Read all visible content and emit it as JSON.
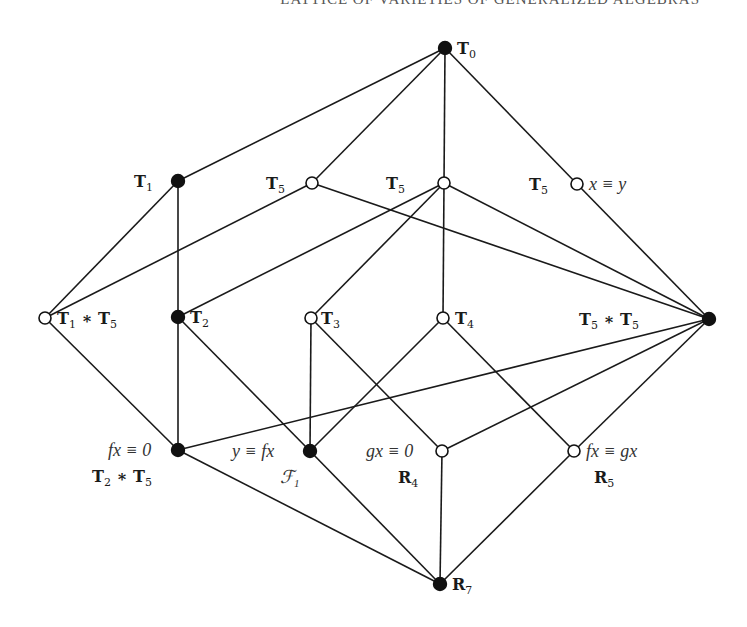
{
  "running_head": "LATTICE OF VARIETIES OF GENERALIZED ALGEBRAS",
  "colors": {
    "edge": "#1a1a1a",
    "filled": "#111111",
    "open": "#ffffff"
  },
  "nodes": [
    {
      "id": "T0",
      "x": 445,
      "y": 48,
      "filled": true,
      "labels": [
        {
          "text": "T",
          "sub": "0",
          "style": "bold",
          "dx": 12,
          "dy": 6
        }
      ]
    },
    {
      "id": "T1",
      "x": 178,
      "y": 181,
      "filled": true,
      "labels": [
        {
          "text": "T",
          "sub": "1",
          "style": "bold",
          "dx": -44,
          "dy": 6
        }
      ]
    },
    {
      "id": "T5a",
      "x": 312,
      "y": 183,
      "filled": false,
      "labels": [
        {
          "text": "T",
          "sub": "5",
          "style": "bold",
          "dx": -46,
          "dy": 6
        }
      ]
    },
    {
      "id": "T5b",
      "x": 444,
      "y": 183,
      "filled": false,
      "labels": [
        {
          "text": "T",
          "sub": "5",
          "style": "bold",
          "dx": -58,
          "dy": 6
        }
      ]
    },
    {
      "id": "T5c",
      "x": 577,
      "y": 184,
      "filled": false,
      "labels": [
        {
          "text": "T",
          "sub": "5",
          "style": "bold",
          "dx": -48,
          "dy": 6
        },
        {
          "text": "x ≡ y",
          "style": "italic",
          "dx": 12,
          "dy": 6
        }
      ]
    },
    {
      "id": "T1T5",
      "x": 45,
      "y": 318,
      "filled": false,
      "labels": [
        {
          "text": "T",
          "sub": "1",
          "mid": " ∗ T",
          "sub2": "5",
          "style": "bold",
          "dx": 12,
          "dy": 6
        }
      ]
    },
    {
      "id": "T2",
      "x": 178,
      "y": 317,
      "filled": true,
      "labels": [
        {
          "text": "T",
          "sub": "2",
          "style": "bold",
          "dx": 12,
          "dy": 6
        }
      ]
    },
    {
      "id": "T3",
      "x": 311,
      "y": 318,
      "filled": false,
      "labels": [
        {
          "text": "T",
          "sub": "3",
          "style": "bold",
          "dx": 10,
          "dy": 6
        }
      ]
    },
    {
      "id": "T4",
      "x": 443,
      "y": 318,
      "filled": false,
      "labels": [
        {
          "text": "T",
          "sub": "4",
          "style": "bold",
          "dx": 12,
          "dy": 6
        }
      ]
    },
    {
      "id": "T5T5",
      "x": 709,
      "y": 319,
      "filled": true,
      "labels": [
        {
          "text": "T",
          "sub": "5",
          "mid": " ∗ T",
          "sub2": "5",
          "style": "bold",
          "dx": -130,
          "dy": 6
        }
      ]
    },
    {
      "id": "T2T5",
      "x": 178,
      "y": 450,
      "filled": true,
      "labels": [
        {
          "text": "fx ≡ 0",
          "style": "italic",
          "dx": -70,
          "dy": 6
        },
        {
          "text": "T",
          "sub": "2",
          "mid": " ∗ T",
          "sub2": "5",
          "style": "bold",
          "dx": -86,
          "dy": 32
        }
      ]
    },
    {
      "id": "F1",
      "x": 310,
      "y": 451,
      "filled": true,
      "labels": [
        {
          "text": "y ≡ fx",
          "style": "italic",
          "dx": -78,
          "dy": 6
        },
        {
          "text": "ℱ",
          "sub": "1",
          "style": "italic",
          "dx": -30,
          "dy": 32
        }
      ]
    },
    {
      "id": "R4",
      "x": 442,
      "y": 451,
      "filled": false,
      "labels": [
        {
          "text": "gx ≡ 0",
          "style": "italic",
          "dx": -76,
          "dy": 6
        },
        {
          "text": "R",
          "sub": "4",
          "style": "bold",
          "dx": -44,
          "dy": 32
        }
      ]
    },
    {
      "id": "R5",
      "x": 574,
      "y": 451,
      "filled": false,
      "labels": [
        {
          "text": "fx ≡ gx",
          "style": "italic",
          "dx": 12,
          "dy": 6
        },
        {
          "text": "R",
          "sub": "5",
          "style": "bold",
          "dx": 20,
          "dy": 32
        }
      ]
    },
    {
      "id": "R7",
      "x": 440,
      "y": 584,
      "filled": true,
      "labels": [
        {
          "text": "R",
          "sub": "7",
          "style": "bold",
          "dx": 12,
          "dy": 6
        }
      ]
    }
  ],
  "edges": [
    [
      "T0",
      "T1"
    ],
    [
      "T0",
      "T5a"
    ],
    [
      "T0",
      "T5b"
    ],
    [
      "T0",
      "T5c"
    ],
    [
      "T1",
      "T2"
    ],
    [
      "T1",
      "T1T5"
    ],
    [
      "T5a",
      "T1T5"
    ],
    [
      "T5a",
      "T5T5"
    ],
    [
      "T5b",
      "T2"
    ],
    [
      "T5b",
      "T3"
    ],
    [
      "T5b",
      "T4"
    ],
    [
      "T5b",
      "T5T5"
    ],
    [
      "T5c",
      "T5T5"
    ],
    [
      "T1T5",
      "T2T5"
    ],
    [
      "T2",
      "T2T5"
    ],
    [
      "T2",
      "F1"
    ],
    [
      "T3",
      "F1"
    ],
    [
      "T3",
      "R4"
    ],
    [
      "T4",
      "F1"
    ],
    [
      "T4",
      "R5"
    ],
    [
      "T5T5",
      "T2T5"
    ],
    [
      "T5T5",
      "R4"
    ],
    [
      "T5T5",
      "R5"
    ],
    [
      "T2T5",
      "R7"
    ],
    [
      "F1",
      "R7"
    ],
    [
      "R4",
      "R7"
    ],
    [
      "R5",
      "R7"
    ]
  ]
}
